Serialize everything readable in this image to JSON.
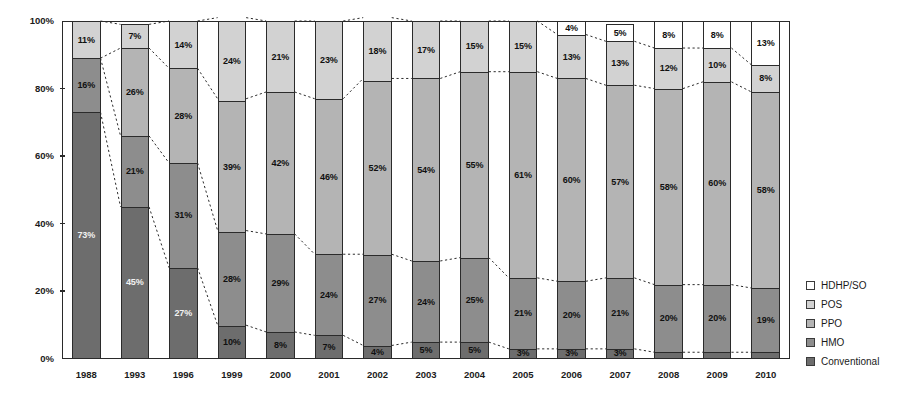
{
  "chart_data": {
    "type": "bar",
    "subtype": "stacked-percentage-column",
    "title": "",
    "xlabel": "",
    "ylabel": "",
    "ylim": [
      0,
      100
    ],
    "yticks": [
      "0%",
      "20%",
      "40%",
      "60%",
      "80%",
      "100%"
    ],
    "ytick_values": [
      0,
      20,
      40,
      60,
      80,
      100
    ],
    "grid": false,
    "legend_position": "right",
    "categories": [
      "1988",
      "1993",
      "1996",
      "1999",
      "2000",
      "2001",
      "2002",
      "2003",
      "2004",
      "2005",
      "2006",
      "2007",
      "2008",
      "2009",
      "2010"
    ],
    "series": [
      {
        "name": "Conventional",
        "color": "#6d6d6d",
        "values": [
          73,
          45,
          27,
          10,
          8,
          7,
          4,
          5,
          5,
          3,
          3,
          3,
          2,
          2,
          2
        ],
        "labels": [
          "73%",
          "45%",
          "27%",
          "10%",
          "8%",
          "7%",
          "4%",
          "5%",
          "5%",
          "3%",
          "3%",
          "3%",
          "",
          "",
          ""
        ]
      },
      {
        "name": "HMO",
        "color": "#8d8d8d",
        "values": [
          16,
          21,
          31,
          28,
          29,
          24,
          27,
          24,
          25,
          21,
          20,
          21,
          20,
          20,
          19
        ],
        "labels": [
          "16%",
          "21%",
          "31%",
          "28%",
          "29%",
          "24%",
          "27%",
          "24%",
          "25%",
          "21%",
          "20%",
          "21%",
          "20%",
          "20%",
          "19%"
        ]
      },
      {
        "name": "PPO",
        "color": "#b4b4b4",
        "values": [
          0,
          26,
          28,
          39,
          42,
          46,
          52,
          54,
          55,
          61,
          60,
          57,
          58,
          60,
          58
        ],
        "labels": [
          "",
          "26%",
          "28%",
          "39%",
          "42%",
          "46%",
          "52%",
          "54%",
          "55%",
          "61%",
          "60%",
          "57%",
          "58%",
          "60%",
          "58%"
        ]
      },
      {
        "name": "POS",
        "color": "#d2d2d2",
        "values": [
          11,
          7,
          14,
          24,
          21,
          23,
          18,
          17,
          15,
          15,
          13,
          13,
          12,
          10,
          8
        ],
        "labels": [
          "11%",
          "7%",
          "14%",
          "24%",
          "21%",
          "23%",
          "18%",
          "17%",
          "15%",
          "15%",
          "13%",
          "13%",
          "12%",
          "10%",
          "8%"
        ]
      },
      {
        "name": "HDHP/SO",
        "color": "#ffffff",
        "values": [
          0,
          0,
          0,
          0,
          0,
          0,
          0,
          0,
          0,
          0,
          4,
          5,
          8,
          8,
          13
        ],
        "labels": [
          "",
          "",
          "",
          "",
          "",
          "",
          "",
          "",
          "",
          "",
          "4%",
          "5%",
          "8%",
          "8%",
          "13%"
        ]
      }
    ],
    "legend_entries": [
      {
        "label": "HDHP/SO",
        "color": "#ffffff"
      },
      {
        "label": "POS",
        "color": "#d2d2d2"
      },
      {
        "label": "PPO",
        "color": "#b4b4b4"
      },
      {
        "label": "HMO",
        "color": "#8d8d8d"
      },
      {
        "label": "Conventional",
        "color": "#6d6d6d"
      }
    ],
    "connector_lines": "dotted lines connecting segment boundaries between adjacent columns"
  }
}
